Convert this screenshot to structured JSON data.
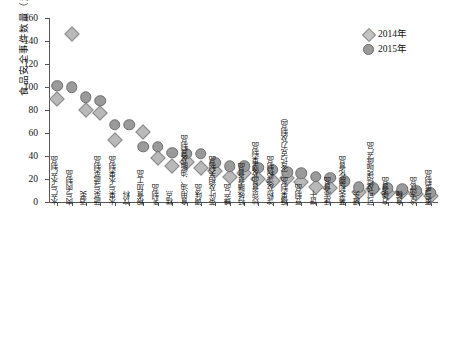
{
  "chart_data": {
    "type": "scatter",
    "title": "",
    "xlabel": "",
    "ylabel": "食品安全事件数量（起）",
    "ylim": [
      0,
      160
    ],
    "ytick_step": 20,
    "yticks": [
      0,
      20,
      40,
      60,
      80,
      100,
      120,
      140,
      160
    ],
    "grid": false,
    "legend_position": "top-right",
    "categories": [
      "水产与水产制品",
      "肉与肉制品",
      "酒类",
      "蔬菜与蔬菜制品",
      "水果与水果制品",
      "饮料",
      "粮食加工品",
      "乳制品",
      "糕点",
      "食用油、油脂及其制品",
      "调味品",
      "茶叶及相关制品",
      "蜂产品",
      "特殊膳食食品",
      "炒货食品及坚果制品",
      "淀粉及淀粉制品",
      "糖果制品（含巧克力及制品）",
      "豆制品",
      "饼干",
      "速冻食品",
      "薯类和膨化食品",
      "罐头",
      "可可及焙烤咖啡产品",
      "方便食品",
      "食糖",
      "冷冻饮品",
      "蛋与蛋制品"
    ],
    "series": [
      {
        "name": "2014年",
        "marker": "diamond",
        "color": "#b9b9b9",
        "values": [
          90,
          146,
          80,
          77,
          54,
          null,
          61,
          38,
          31,
          35,
          30,
          27,
          22,
          25,
          20,
          18,
          21,
          17,
          13,
          12,
          null,
          9,
          11,
          8,
          9,
          7,
          5
        ]
      },
      {
        "name": "2015年",
        "marker": "circle",
        "color": "#9a9a9a",
        "values": [
          101,
          100,
          91,
          88,
          67,
          67,
          48,
          48,
          43,
          42,
          42,
          34,
          31,
          31,
          30,
          28,
          26,
          25,
          22,
          21,
          18,
          13,
          12,
          12,
          11,
          10,
          8
        ]
      }
    ]
  },
  "legend": {
    "items": [
      {
        "label": "2014年",
        "marker": "diamond"
      },
      {
        "label": "2015年",
        "marker": "circle"
      }
    ]
  }
}
